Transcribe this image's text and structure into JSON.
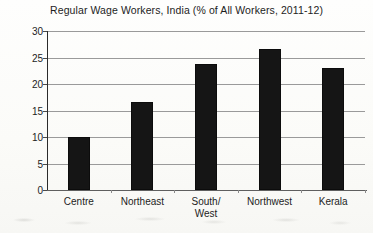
{
  "chart_data": {
    "type": "bar",
    "title": "Regular Wage Workers, India (% of All Workers, 2011-12)",
    "xlabel": "",
    "ylabel": "",
    "categories": [
      "Centre",
      "Northeast",
      "South/\nWest",
      "Northwest",
      "Kerala"
    ],
    "values": [
      10.0,
      16.7,
      23.8,
      26.6,
      23.0
    ],
    "ylim": [
      0,
      30
    ],
    "yticks": [
      0,
      5,
      10,
      15,
      20,
      25,
      30
    ],
    "ytick_labels": [
      "0",
      "5",
      "10",
      "15",
      "20",
      "25",
      "30"
    ],
    "grid": true,
    "legend": false,
    "bar_color": "#151515",
    "gridline_color": "#9a9a9a",
    "axis_color": "#2b2b2b",
    "background_color": "#fdfdfb",
    "text_color": "#1d1d1d"
  }
}
